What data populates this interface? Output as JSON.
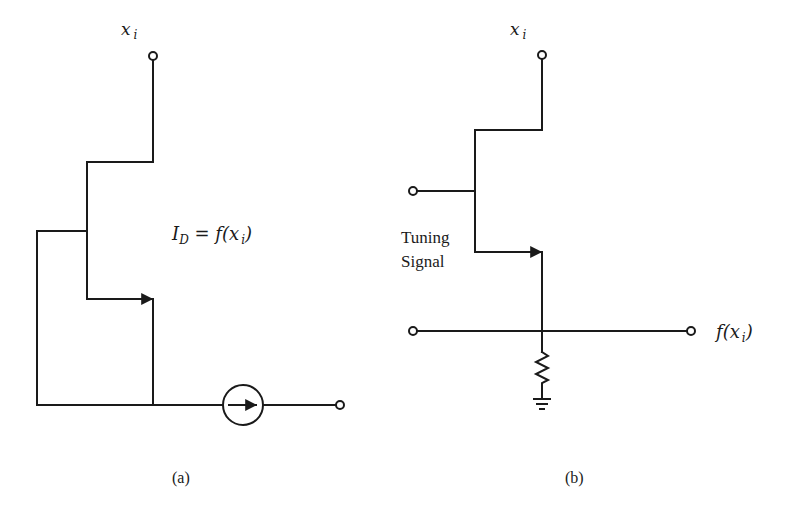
{
  "figure": {
    "panel_a": {
      "caption": "(a)",
      "input_label": "x",
      "input_label_sub": "i",
      "equation_lhs": "I",
      "equation_lhs_sub": "D",
      "equation_rhs": " = f(x",
      "equation_rhs_sub": "i",
      "equation_close": ")",
      "components": [
        "input-terminal",
        "fet-transistor",
        "feedback-loop",
        "current-source",
        "output-terminal"
      ]
    },
    "panel_b": {
      "caption": "(b)",
      "input_label": "x",
      "input_label_sub": "i",
      "tuning_label_line1": "Tuning",
      "tuning_label_line2": "Signal",
      "output_label": "f(x",
      "output_label_sub": "i",
      "output_label_close": ")",
      "components": [
        "input-terminal",
        "gate-terminal",
        "fet-transistor",
        "signal-line",
        "resistor",
        "ground"
      ]
    },
    "colors": {
      "ink": "#1a1a1a",
      "background": "#ffffff"
    }
  }
}
